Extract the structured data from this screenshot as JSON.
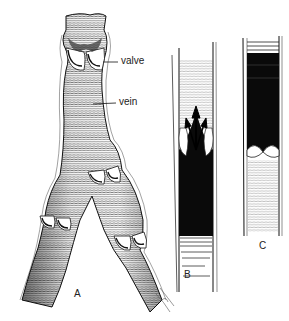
{
  "figure": {
    "panels": [
      {
        "id": "A",
        "label": "A",
        "subject": "branching vein with valves (external view)"
      },
      {
        "id": "B",
        "label": "B",
        "subject": "longitudinal section, valve open with blood flowing upward (arrows)"
      },
      {
        "id": "C",
        "label": "C",
        "subject": "longitudinal section, valve closed with blood held above"
      }
    ],
    "callouts": [
      {
        "text": "valve",
        "target": "upper valve of vein A"
      },
      {
        "text": "vein",
        "target": "vein trunk A"
      }
    ],
    "colors": {
      "ink": "#111111",
      "paper": "#ffffff",
      "blood": "#0a0a0a"
    }
  },
  "labels": {
    "valve": "valve",
    "vein": "vein",
    "panel_a": "A",
    "panel_b": "B",
    "panel_c": "C"
  }
}
